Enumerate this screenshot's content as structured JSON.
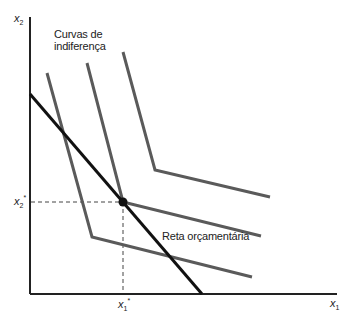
{
  "diagram": {
    "type": "indifference-curves-budget-line",
    "axes": {
      "y_label": "x",
      "y_sub": "2",
      "x_label": "x",
      "x_sub": "1"
    },
    "optimum": {
      "x_label": "x",
      "x_sub": "1",
      "x_sup": "*",
      "y_label": "x",
      "y_sub": "2",
      "y_sup": "*"
    },
    "annotations": {
      "curves_line1": "Curvas de",
      "curves_line2": "indiferença",
      "budget_line": "Reta orçamentária"
    },
    "indifference_curves": [
      {
        "name": "curve-low",
        "points": [
          [
            47,
            73
          ],
          [
            92,
            237
          ],
          [
            252,
            277
          ]
        ]
      },
      {
        "name": "curve-mid",
        "points": [
          [
            87,
            63
          ],
          [
            123,
            202
          ],
          [
            261,
            236
          ]
        ]
      },
      {
        "name": "curve-high",
        "points": [
          [
            123,
            52
          ],
          [
            155,
            170
          ],
          [
            270,
            197
          ]
        ]
      }
    ],
    "budget_line_points": [
      [
        30,
        94
      ],
      [
        202,
        294
      ]
    ],
    "colors": {
      "curves": "#5a5a5a",
      "budget": "#111111",
      "axes": "#222222"
    }
  }
}
